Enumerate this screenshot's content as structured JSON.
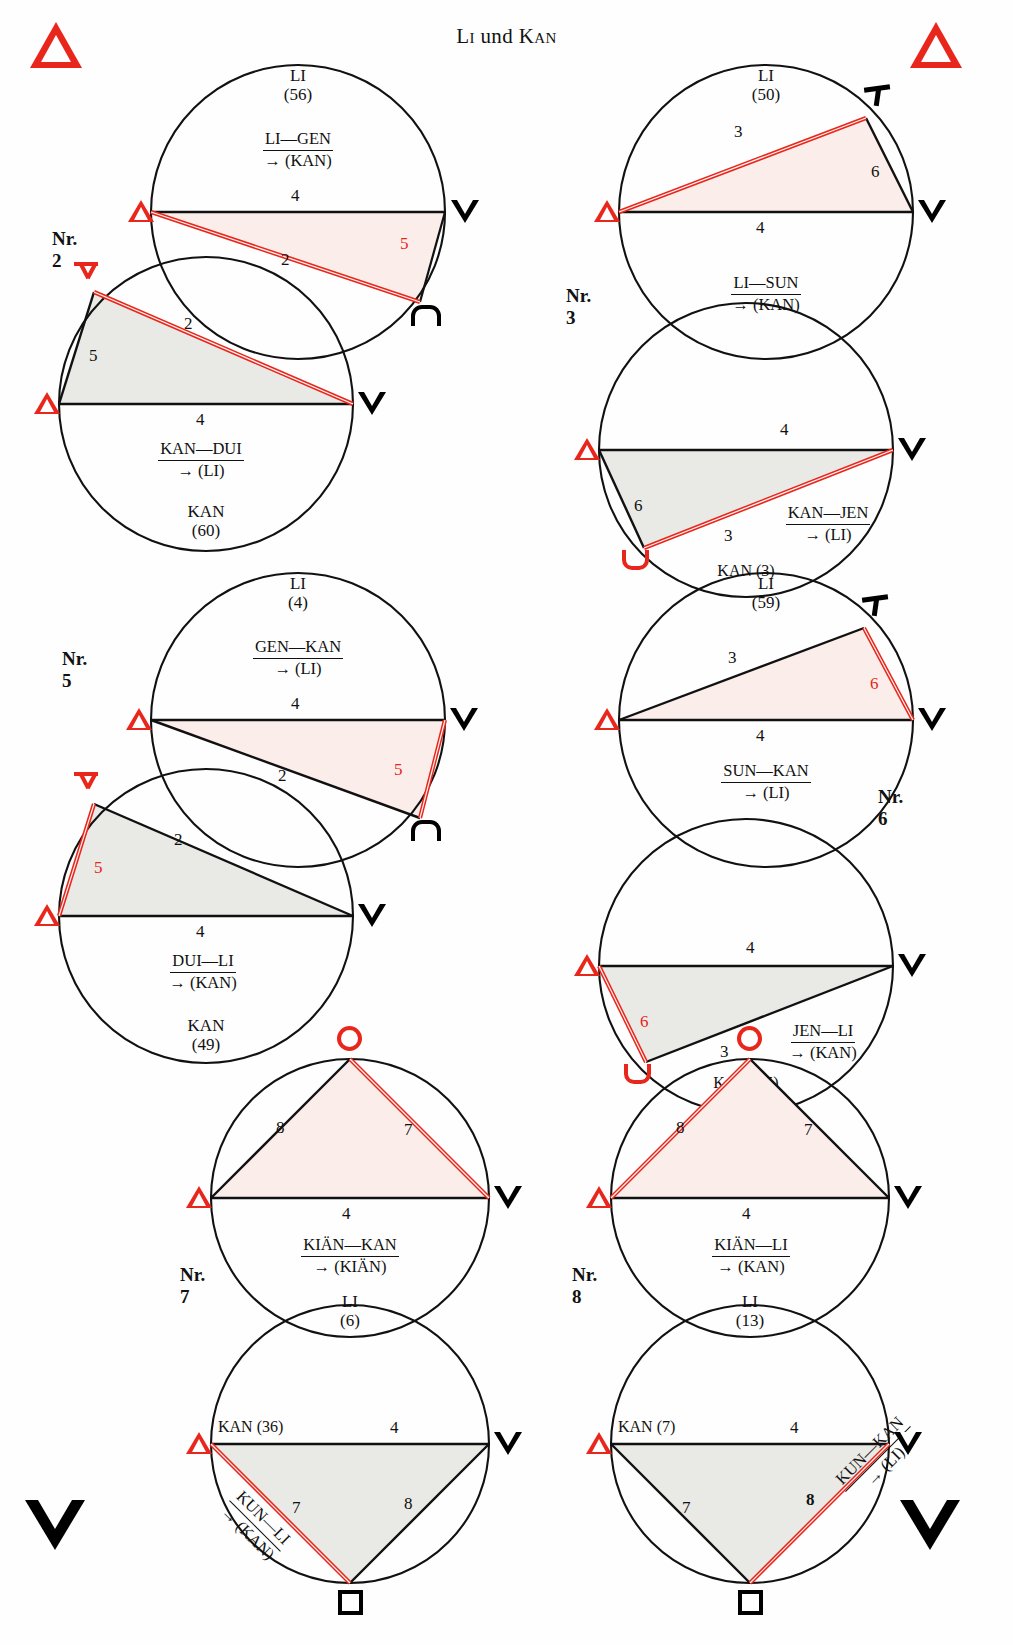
{
  "page": {
    "title": "Li und Kan",
    "title_parts": {
      "li": "Li",
      "und": " und ",
      "kan": "Kan"
    },
    "corner_markers": {
      "top_left": "triangle-up-red",
      "top_right": "triangle-up-red",
      "bottom_left": "triangle-down-black",
      "bottom_right": "triangle-down-black"
    },
    "colors": {
      "red": "#e8261b",
      "black": "#111111",
      "fill_warm": "#fbeeea",
      "fill_grey": "#e9e9e6"
    }
  },
  "figures": [
    {
      "id": "nr2",
      "number_label": "Nr. 2",
      "upper": {
        "top_label": "LI",
        "top_value": "(56)",
        "relation_top": "LI—GEN",
        "relation_bottom": "→ (KAN)",
        "diameter_label": "4",
        "side_a": {
          "value": "2",
          "color": "black"
        },
        "side_b": {
          "value": "5",
          "color": "red"
        },
        "left_marker": "triangle-up-red",
        "right_marker": "triangle-down-black",
        "vertex_marker": "arch-black"
      },
      "lower": {
        "relation_top": "KAN—DUI",
        "relation_bottom": "→ (LI)",
        "diameter_label": "4",
        "side_a": {
          "value": "2",
          "color": "red"
        },
        "side_b": {
          "value": "5",
          "color": "black"
        },
        "bottom_label": "KAN",
        "bottom_value": "(60)",
        "left_marker": "triangle-up-red",
        "right_marker": "triangle-down-black",
        "vertex_marker": "arrow-down-red"
      }
    },
    {
      "id": "nr3",
      "number_label": "Nr. 3",
      "upper": {
        "top_label": "LI",
        "top_value": "(50)",
        "relation_top": "LI—SUN",
        "relation_bottom": "→ (KAN)",
        "diameter_label": "4",
        "side_a": {
          "value": "3",
          "color": "red"
        },
        "side_b": {
          "value": "6",
          "color": "black"
        },
        "left_marker": "triangle-up-red",
        "right_marker": "triangle-down-black",
        "vertex_marker": "tee-black"
      },
      "lower": {
        "relation_top": "KAN—JEN",
        "relation_bottom": "→ (LI)",
        "diameter_label": "4",
        "side_a": {
          "value": "3",
          "color": "red"
        },
        "side_b": {
          "value": "6",
          "color": "black"
        },
        "bottom_label": "KAN (3)",
        "left_marker": "triangle-up-red",
        "right_marker": "triangle-down-black",
        "vertex_marker": "u-cup-red"
      }
    },
    {
      "id": "nr5",
      "number_label": "Nr. 5",
      "upper": {
        "top_label": "LI",
        "top_value": "(4)",
        "relation_top": "GEN—KAN",
        "relation_bottom": "→ (LI)",
        "diameter_label": "4",
        "side_a": {
          "value": "2",
          "color": "black"
        },
        "side_b": {
          "value": "5",
          "color": "red"
        },
        "left_marker": "triangle-up-red",
        "right_marker": "triangle-down-black",
        "vertex_marker": "arch-black"
      },
      "lower": {
        "relation_top": "DUI—LI",
        "relation_bottom": "→ (KAN)",
        "diameter_label": "4",
        "side_a": {
          "value": "2",
          "color": "black"
        },
        "side_b": {
          "value": "5",
          "color": "red"
        },
        "bottom_label": "KAN",
        "bottom_value": "(49)",
        "left_marker": "triangle-up-red",
        "right_marker": "triangle-down-black",
        "vertex_marker": "arrow-down-red"
      }
    },
    {
      "id": "nr6",
      "number_label": "Nr. 6",
      "upper": {
        "top_label": "LI",
        "top_value": "(59)",
        "relation_top": "SUN—KAN",
        "relation_bottom": "→ (LI)",
        "diameter_label": "4",
        "side_a": {
          "value": "3",
          "color": "black"
        },
        "side_b": {
          "value": "6",
          "color": "red"
        },
        "left_marker": "triangle-up-red",
        "right_marker": "triangle-down-black",
        "vertex_marker": "tee-black"
      },
      "lower": {
        "relation_top": "JEN—LI",
        "relation_bottom": "→ (KAN)",
        "diameter_label": "4",
        "side_a": {
          "value": "3",
          "color": "black"
        },
        "side_b": {
          "value": "6",
          "color": "red"
        },
        "bottom_label": "KAN (55)",
        "left_marker": "triangle-up-red",
        "right_marker": "triangle-down-black",
        "vertex_marker": "u-cup-red"
      }
    },
    {
      "id": "nr7",
      "number_label": "Nr. 7",
      "upper": {
        "relation_top": "KIÄN—KAN",
        "relation_bottom": "→ (KIÄN)",
        "diameter_label": "4",
        "side_a": {
          "value": "8",
          "color": "black"
        },
        "side_b": {
          "value": "7",
          "color": "red"
        },
        "bottom_label": "LI",
        "bottom_value": "(6)",
        "left_marker": "triangle-up-red",
        "right_marker": "triangle-down-black",
        "vertex_marker": "circle-red"
      },
      "lower": {
        "relation_top": "KUN—LI",
        "relation_bottom": "→ (KAN)",
        "diameter_label": "4",
        "top_label": "KAN (36)",
        "side_a": {
          "value": "7",
          "color": "red"
        },
        "side_b": {
          "value": "8",
          "color": "black"
        },
        "left_marker": "triangle-up-red",
        "right_marker": "triangle-down-black",
        "vertex_marker": "square-black"
      }
    },
    {
      "id": "nr8",
      "number_label": "Nr. 8",
      "upper": {
        "relation_top": "KIÄN—LI",
        "relation_bottom": "→ (KAN)",
        "diameter_label": "4",
        "side_a": {
          "value": "8",
          "color": "red"
        },
        "side_b": {
          "value": "7",
          "color": "black"
        },
        "bottom_label": "LI",
        "bottom_value": "(13)",
        "left_marker": "triangle-up-red",
        "right_marker": "triangle-down-black",
        "vertex_marker": "circle-red"
      },
      "lower": {
        "relation_top": "KUN—KAN",
        "relation_bottom": "→ (LI)",
        "diameter_label": "4",
        "top_label": "KAN (7)",
        "side_a": {
          "value": "7",
          "color": "black"
        },
        "side_b": {
          "value": "8",
          "color": "red"
        },
        "left_marker": "triangle-up-red",
        "right_marker": "triangle-down-black",
        "vertex_marker": "square-black"
      }
    }
  ]
}
